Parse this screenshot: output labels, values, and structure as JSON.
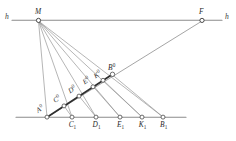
{
  "figure": {
    "background_color": "#ffffff",
    "line_color": "#8e8e8e",
    "accent_color": "#2f2f2f",
    "axis_labels": {
      "horizon_left": "h",
      "horizon_right": "h"
    },
    "points": {
      "M": {
        "label": "M",
        "sup": "",
        "sub": ""
      },
      "F": {
        "label": "F",
        "sup": "",
        "sub": ""
      },
      "A0": {
        "label": "A",
        "sup": "0",
        "sub": ""
      },
      "C0": {
        "label": "C",
        "sup": "0",
        "sub": ""
      },
      "D0": {
        "label": "D",
        "sup": "0",
        "sub": ""
      },
      "E0": {
        "label": "E",
        "sup": "0",
        "sub": ""
      },
      "K0": {
        "label": "K",
        "sup": "0",
        "sub": ""
      },
      "B0": {
        "label": "B",
        "sup": "0",
        "sub": ""
      },
      "C1": {
        "label": "C",
        "sup": "",
        "sub": "1"
      },
      "D1": {
        "label": "D",
        "sup": "",
        "sub": "1"
      },
      "E1": {
        "label": "E",
        "sup": "",
        "sub": "1"
      },
      "K1": {
        "label": "K",
        "sup": "",
        "sub": "1"
      },
      "B1": {
        "label": "B",
        "sup": "",
        "sub": "1"
      }
    }
  }
}
